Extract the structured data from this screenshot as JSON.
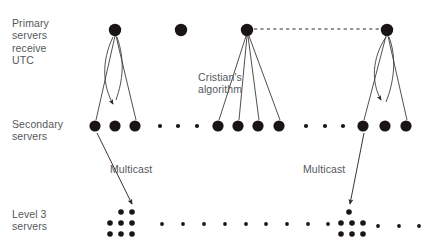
{
  "diagram": {
    "colors": {
      "node": "#1a1416",
      "line": "#3c3c3c",
      "text": "#55585c",
      "background": "#ffffff"
    },
    "row_labels": [
      {
        "id": "primary-servers",
        "lines": [
          "Primary",
          "servers",
          "receive",
          "UTC"
        ],
        "text": "Primary\nservers\nreceive\nUTC"
      },
      {
        "id": "secondary-servers",
        "lines": [
          "Secondary",
          "servers"
        ],
        "text": "Secondary\nservers"
      },
      {
        "id": "level-3-servers",
        "lines": [
          "Level 3",
          "servers"
        ],
        "text": "Level 3\nservers"
      }
    ],
    "annotations": [
      {
        "id": "cristians-algorithm",
        "lines": [
          "Cristian's",
          "algorithm"
        ],
        "text": "Cristian's\nalgorithm"
      },
      {
        "id": "multicast-left",
        "text": "Multicast"
      },
      {
        "id": "multicast-right",
        "text": "Multicast"
      }
    ],
    "rows": {
      "primary": {
        "y": 30,
        "node_radius": 6,
        "nodes": [
          {
            "id": "primary-1",
            "x": 115,
            "y": 30
          },
          {
            "id": "primary-2",
            "x": 181,
            "y": 30
          },
          {
            "id": "primary-3",
            "x": 247,
            "y": 30
          },
          {
            "id": "primary-4",
            "x": 387,
            "y": 30
          }
        ]
      },
      "secondary": {
        "y": 126,
        "node_radius": 5.5,
        "nodes": [
          {
            "id": "secondary-1",
            "x": 95,
            "y": 126
          },
          {
            "id": "secondary-2",
            "x": 115,
            "y": 126
          },
          {
            "id": "secondary-3",
            "x": 135,
            "y": 126
          },
          {
            "id": "secondary-4",
            "x": 218,
            "y": 126
          },
          {
            "id": "secondary-5",
            "x": 238,
            "y": 126
          },
          {
            "id": "secondary-6",
            "x": 258,
            "y": 126
          },
          {
            "id": "secondary-7",
            "x": 279,
            "y": 126
          },
          {
            "id": "secondary-8",
            "x": 363,
            "y": 126
          },
          {
            "id": "secondary-9",
            "x": 385,
            "y": 126
          },
          {
            "id": "secondary-10",
            "x": 406,
            "y": 126
          }
        ],
        "ellipsis_dots": [
          {
            "x": 160,
            "y": 126
          },
          {
            "x": 178,
            "y": 126
          },
          {
            "x": 197,
            "y": 126
          },
          {
            "x": 306,
            "y": 126
          },
          {
            "x": 325,
            "y": 126
          },
          {
            "x": 343,
            "y": 126
          }
        ],
        "ellipsis_radius": 2
      },
      "level3": {
        "node_radius": 2.7,
        "clusters": [
          {
            "id": "level3-cluster-left",
            "dots": [
              {
                "x": 121,
                "y": 212
              },
              {
                "x": 132,
                "y": 212
              },
              {
                "x": 110,
                "y": 223
              },
              {
                "x": 121,
                "y": 223
              },
              {
                "x": 132,
                "y": 223
              },
              {
                "x": 110,
                "y": 234
              },
              {
                "x": 121,
                "y": 234
              },
              {
                "x": 132,
                "y": 234
              }
            ]
          },
          {
            "id": "level3-cluster-right",
            "dots": [
              {
                "x": 349,
                "y": 212
              },
              {
                "x": 341,
                "y": 223
              },
              {
                "x": 352,
                "y": 223
              },
              {
                "x": 363,
                "y": 223
              },
              {
                "x": 341,
                "y": 234
              },
              {
                "x": 352,
                "y": 234
              },
              {
                "x": 363,
                "y": 234
              }
            ]
          }
        ],
        "ellipsis_dots": [
          {
            "x": 162,
            "y": 224
          },
          {
            "x": 183,
            "y": 224
          },
          {
            "x": 204,
            "y": 224
          },
          {
            "x": 225,
            "y": 224
          },
          {
            "x": 246,
            "y": 224
          },
          {
            "x": 266,
            "y": 224
          },
          {
            "x": 287,
            "y": 224
          },
          {
            "x": 308,
            "y": 224
          },
          {
            "x": 328,
            "y": 224
          },
          {
            "x": 378,
            "y": 226
          },
          {
            "x": 399,
            "y": 226
          },
          {
            "x": 419,
            "y": 226
          }
        ],
        "ellipsis_radius": 1.9
      }
    },
    "edges": {
      "primary_to_secondary": [
        {
          "from": "primary-1",
          "to": "secondary-1",
          "x1": 115,
          "y1": 36,
          "x2": 96,
          "y2": 120
        },
        {
          "from": "primary-1",
          "to": "secondary-3",
          "x1": 116,
          "y1": 36,
          "x2": 136,
          "y2": 120
        },
        {
          "from": "primary-3",
          "to": "secondary-4",
          "x1": 246,
          "y1": 36,
          "x2": 219,
          "y2": 120
        },
        {
          "from": "primary-3",
          "to": "secondary-5",
          "x1": 247,
          "y1": 36,
          "x2": 239,
          "y2": 120
        },
        {
          "from": "primary-3",
          "to": "secondary-6",
          "x1": 248,
          "y1": 36,
          "x2": 259,
          "y2": 120
        },
        {
          "from": "primary-3",
          "to": "secondary-7",
          "x1": 249,
          "y1": 36,
          "x2": 280,
          "y2": 120
        },
        {
          "from": "primary-4",
          "to": "secondary-8",
          "x1": 386,
          "y1": 36,
          "x2": 364,
          "y2": 120
        },
        {
          "from": "primary-4",
          "to": "secondary-10",
          "x1": 388,
          "y1": 36,
          "x2": 407,
          "y2": 120
        }
      ],
      "dashed_peer": {
        "from": "primary-3",
        "to": "primary-4",
        "x1": 254,
        "y1": 29,
        "x2": 380,
        "y2": 29
      },
      "cristian_arcs": [
        {
          "id": "cristian-arc-left",
          "from": "primary-1",
          "to": "secondary-2"
        },
        {
          "id": "cristian-arc-right",
          "from": "primary-4",
          "to": "secondary-9"
        }
      ],
      "multicast_arrows": [
        {
          "id": "multicast-arrow-left",
          "x1": 97,
          "y1": 133,
          "x2": 133,
          "y2": 206
        },
        {
          "id": "multicast-arrow-right",
          "x1": 364,
          "y1": 133,
          "x2": 349,
          "y2": 206
        }
      ]
    }
  }
}
